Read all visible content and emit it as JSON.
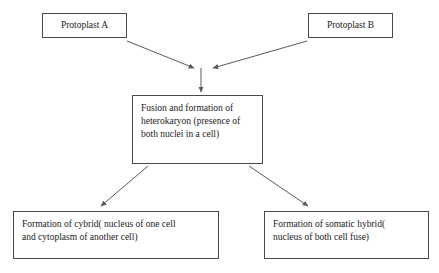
{
  "diagram": {
    "background_color": "#ffffff",
    "box_border_color": "#4a4a4a",
    "arrow_color": "#5a5a5a",
    "text_color": "#1a1a1a",
    "nodes": [
      {
        "id": "protoplast-a",
        "label": "Protoplast A",
        "role": "source-top-left"
      },
      {
        "id": "protoplast-b",
        "label": "Protoplast B",
        "role": "source-top-right"
      },
      {
        "id": "fusion",
        "label": "Fusion and formation of\nheterokaryon (presence of\nboth nuclei in a cell)",
        "role": "center-process"
      },
      {
        "id": "cybrid",
        "label": "Formation of cybrid( nucleus of one cell\nand cytoplasm of another cell)",
        "role": "outcome-bottom-left"
      },
      {
        "id": "somatic",
        "label": "Formation of somatic hybrid(\nnucleus of both cell fuse)",
        "role": "outcome-bottom-right"
      }
    ],
    "edges": [
      {
        "id": "edge-a-to-junction",
        "from": "protoplast-a",
        "to": "fusion"
      },
      {
        "id": "edge-b-to-junction",
        "from": "protoplast-b",
        "to": "fusion"
      },
      {
        "id": "edge-junction-to-fusion",
        "from": "junction",
        "to": "fusion"
      },
      {
        "id": "edge-fusion-to-cybrid",
        "from": "fusion",
        "to": "cybrid"
      },
      {
        "id": "edge-fusion-to-somatic",
        "from": "fusion",
        "to": "somatic"
      }
    ]
  }
}
